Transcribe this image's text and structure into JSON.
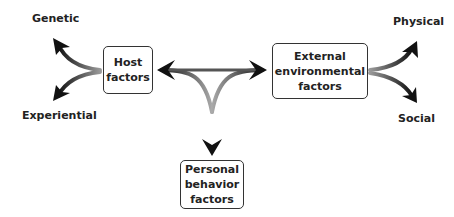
{
  "diagram": {
    "boxes": {
      "host": {
        "line1": "Host",
        "line2": "factors"
      },
      "external": {
        "line1": "External",
        "line2": "environmental",
        "line3": "factors"
      },
      "personal": {
        "line1": "Personal",
        "line2": "behavior",
        "line3": "factors"
      }
    },
    "labels": {
      "genetic": "Genetic",
      "experiential": "Experiential",
      "physical": "Physical",
      "social": "Social"
    },
    "colors": {
      "arrow_dark": "#1a1a1a",
      "arrow_light": "#bdbdbd",
      "border": "#333333"
    }
  }
}
